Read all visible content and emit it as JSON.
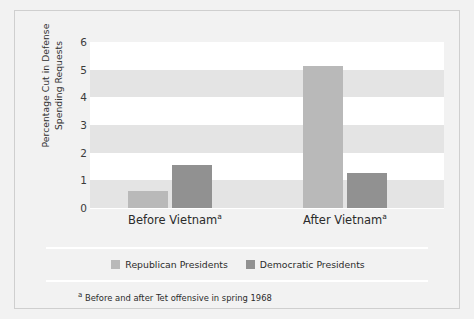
{
  "chart_data": {
    "type": "bar",
    "title": "",
    "xlabel": "",
    "ylabel": "Percentage Cut in Defense Spending Requests",
    "categories": [
      "Before Vietnam",
      "After Vietnam"
    ],
    "category_footnote_marks": [
      "a",
      "a"
    ],
    "series": [
      {
        "name": "Republican Presidents",
        "color": "#b9b9b9",
        "values": [
          0.6,
          5.15
        ]
      },
      {
        "name": "Democratic Presidents",
        "color": "#919191",
        "values": [
          1.55,
          1.25
        ]
      }
    ],
    "ylim": [
      0,
      6
    ],
    "yticks": [
      0,
      1,
      2,
      3,
      4,
      5,
      6
    ],
    "ytick_labels": [
      "0",
      "1",
      "2",
      "3",
      "4",
      "5",
      "6"
    ],
    "grid": "horizontal-banding",
    "legend_position": "bottom"
  },
  "axis": {
    "y_title": "Percentage Cut in Defense Spending Requests",
    "tick_labels": [
      "6",
      "5",
      "4",
      "3",
      "2",
      "1",
      "0"
    ]
  },
  "categories": [
    {
      "label": "Before Vietnam",
      "mark": "a"
    },
    {
      "label": "After Vietnam",
      "mark": "a"
    }
  ],
  "legend": {
    "items": [
      {
        "label": "Republican Presidents",
        "color": "#b9b9b9"
      },
      {
        "label": "Democratic Presidents",
        "color": "#919191"
      }
    ]
  },
  "footnote": {
    "mark": "a",
    "text": "Before and after Tet offensive in spring 1968"
  },
  "colors": {
    "background": "#f2f2f2",
    "plot_background": "#ffffff",
    "band": "#e4e4e4",
    "republican": "#b9b9b9",
    "democratic": "#919191",
    "text": "#2b2b2b"
  }
}
